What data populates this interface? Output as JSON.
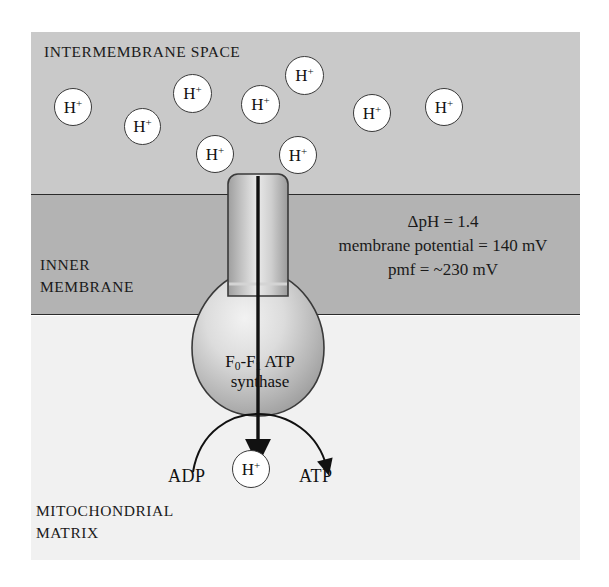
{
  "figure": {
    "cropped_top_text": "",
    "colors": {
      "intermembrane_space": "#c9c9c9",
      "inner_membrane": "#b3b3b3",
      "mitochondrial_matrix": "#f1f1f1",
      "outline": "#2b2b2b",
      "proton_fill": "#ffffff",
      "synthase_light": "#e8e8e8",
      "synthase_dark": "#9a9a9a"
    }
  },
  "regions": {
    "intermembrane_space": {
      "label": "INTERMEMBRANE SPACE"
    },
    "inner_membrane": {
      "label_line1": "INNER",
      "label_line2": "MEMBRANE"
    },
    "mitochondrial_matrix": {
      "label_line1": "MITOCHONDRIAL",
      "label_line2": "MATRIX"
    }
  },
  "annotations": {
    "delta_ph": "ΔpH = 1.4",
    "membrane_potential": "membrane potential = 140 mV",
    "pmf": "pmf = ~230 mV"
  },
  "protons": {
    "glyph_h": "H",
    "glyph_plus": "+",
    "positions": [
      {
        "x": 54,
        "y": 88,
        "d": 38
      },
      {
        "x": 124,
        "y": 108,
        "d": 37
      },
      {
        "x": 173,
        "y": 74,
        "d": 39
      },
      {
        "x": 196,
        "y": 135,
        "d": 38
      },
      {
        "x": 241,
        "y": 85,
        "d": 39
      },
      {
        "x": 279,
        "y": 136,
        "d": 38
      },
      {
        "x": 285,
        "y": 56,
        "d": 39
      },
      {
        "x": 353,
        "y": 94,
        "d": 38
      },
      {
        "x": 425,
        "y": 88,
        "d": 38
      }
    ],
    "product_proton": {
      "x": 232,
      "y": 450,
      "d": 38
    }
  },
  "complex": {
    "name_line1_pre": "F",
    "name_line1_sub1": "0",
    "name_line1_mid": "-F",
    "name_line1_sub2": "1",
    "name_line1_post": " ATP",
    "name_line2": "synthase"
  },
  "reaction": {
    "substrate_label": "ADP",
    "product_label": "ATP"
  }
}
